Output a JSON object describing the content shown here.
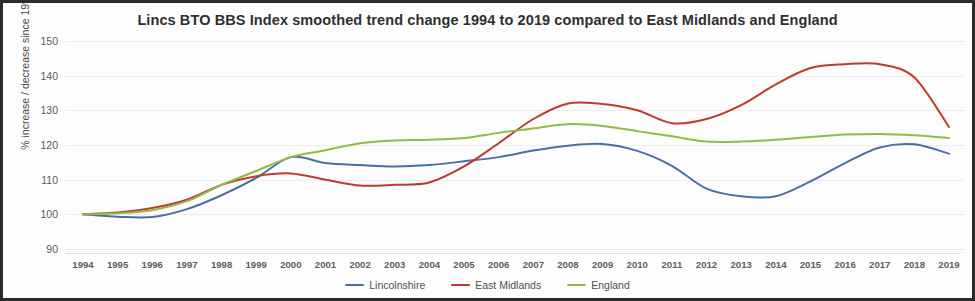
{
  "chart_data": {
    "type": "line",
    "title": "Lincs BTO BBS Index smoothed trend change 1994 to 2019 compared to East Midlands and England",
    "xlabel": "",
    "ylabel": "% increase / decrease since 1994",
    "x": [
      1994,
      1995,
      1996,
      1997,
      1998,
      1999,
      2000,
      2001,
      2002,
      2003,
      2004,
      2005,
      2006,
      2007,
      2008,
      2009,
      2010,
      2011,
      2012,
      2013,
      2014,
      2015,
      2016,
      2017,
      2018,
      2019
    ],
    "xtick_labels": [
      "1994",
      "1995",
      "1996",
      "1997",
      "1998",
      "1999",
      "2000",
      "2001",
      "2002",
      "2003",
      "2004",
      "2005",
      "2006",
      "2007",
      "2008",
      "2009",
      "2010",
      "2011",
      "2012",
      "2013",
      "2014",
      "2015",
      "2016",
      "2017",
      "2018",
      "2019"
    ],
    "ytick_labels": [
      "150",
      "140",
      "130",
      "120",
      "110",
      "100",
      "90"
    ],
    "yticks": [
      150,
      140,
      130,
      120,
      110,
      100,
      90
    ],
    "ylim": [
      90,
      150
    ],
    "grid": true,
    "legend_position": "bottom",
    "series": [
      {
        "name": "Lincolnshire",
        "color": "#4a6fa5",
        "values": [
          100,
          99.3,
          99.2,
          101.5,
          105.5,
          110.5,
          116.5,
          114.8,
          114.2,
          113.8,
          114.2,
          115.3,
          116.5,
          118.4,
          119.8,
          120.3,
          118.3,
          114.0,
          107.4,
          105.2,
          105.2,
          109.5,
          114.8,
          119.3,
          120.2,
          117.5
        ]
      },
      {
        "name": "East Midlands",
        "color": "#c0392b",
        "values": [
          100,
          100.5,
          101.8,
          104.2,
          108.5,
          111.0,
          111.8,
          110.0,
          108.3,
          108.5,
          109.2,
          113.8,
          120.5,
          127.5,
          132.0,
          131.8,
          130.0,
          126.3,
          127.5,
          131.5,
          137.5,
          142.2,
          143.3,
          143.3,
          139.5,
          125.2
        ]
      },
      {
        "name": "England",
        "color": "#8fbc45",
        "values": [
          100,
          100.3,
          101.2,
          103.8,
          108.5,
          112.5,
          116.5,
          118.5,
          120.5,
          121.3,
          121.5,
          122.0,
          123.5,
          124.8,
          126.0,
          125.5,
          124.0,
          122.5,
          121.0,
          121.0,
          121.5,
          122.3,
          123.0,
          123.2,
          122.8,
          122.0
        ]
      }
    ]
  },
  "legend": {
    "items": [
      {
        "label": "Lincolnshire",
        "color": "#4a6fa5"
      },
      {
        "label": "East Midlands",
        "color": "#c0392b"
      },
      {
        "label": "England",
        "color": "#8fbc45"
      }
    ]
  }
}
